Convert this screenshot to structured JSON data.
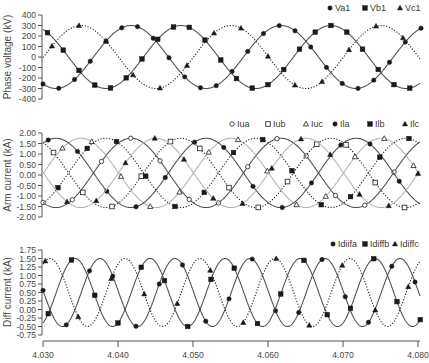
{
  "figure": {
    "x_axis": {
      "ticks": [
        "4.030",
        "4.040",
        "4.050",
        "4.060",
        "4.070",
        "4.080"
      ],
      "tick_values": [
        4.03,
        4.04,
        4.05,
        4.06,
        4.07,
        4.08
      ],
      "xlim": [
        4.03,
        4.08
      ]
    }
  },
  "chart_data": [
    {
      "type": "line",
      "title": "",
      "xlabel": "",
      "ylabel": "Phase voltage (kV)",
      "xlim": [
        4.03,
        4.08
      ],
      "ylim": [
        -400,
        400
      ],
      "yticks": [
        "400",
        "300",
        "200",
        "100",
        "0",
        "-100",
        "-200",
        "-300",
        "-400"
      ],
      "grid": false,
      "legend_position": "top-right",
      "x": [
        4.03,
        4.0325,
        4.035,
        4.0375,
        4.04,
        4.0425,
        4.045,
        4.0475,
        4.05,
        4.0525,
        4.055,
        4.0575,
        4.06,
        4.0625,
        4.065,
        4.0675,
        4.07,
        4.0725,
        4.075,
        4.0775,
        4.08
      ],
      "series": [
        {
          "name": "Va1",
          "marker": "filled-circle",
          "line": "solid-dark",
          "amplitude": 300,
          "offset": 0,
          "frequency_hz": 50,
          "peak_time": 4.04173,
          "marker_every_ms": 2.1,
          "marker_start_ms": 0.0,
          "values": [
            -257,
            -291,
            -155,
            72,
            257,
            291,
            155,
            -72,
            -257,
            -291,
            -155,
            72,
            257,
            291,
            155,
            -72,
            -257,
            -291,
            -155,
            72,
            257
          ]
        },
        {
          "name": "Vb1",
          "marker": "filled-square",
          "line": "solid-dark",
          "amplitude": 300,
          "offset": 0,
          "frequency_hz": 50,
          "peak_time": 4.0484,
          "marker_every_ms": 2.1,
          "marker_start_ms": 0.6,
          "values": [
            263,
            84,
            -145,
            -288,
            -263,
            -84,
            145,
            288,
            263,
            84,
            -145,
            -288,
            -263,
            -84,
            145,
            288,
            263,
            84,
            -145,
            -288,
            -263
          ]
        },
        {
          "name": "Vc1",
          "marker": "filled-triangle",
          "line": "dotted",
          "amplitude": 300,
          "offset": 0,
          "frequency_hz": 50,
          "peak_time": 4.03507,
          "marker_every_ms": 3.6,
          "marker_start_ms": 1.2,
          "values": [
            -6,
            208,
            300,
            217,
            6,
            -208,
            -300,
            -217,
            -6,
            208,
            300,
            217,
            6,
            -208,
            -300,
            -217,
            -6,
            208,
            300,
            217,
            6
          ]
        }
      ]
    },
    {
      "type": "line",
      "title": "",
      "xlabel": "",
      "ylabel": "Arm current (kA)",
      "xlim": [
        4.03,
        4.08
      ],
      "ylim": [
        -2.0,
        2.0
      ],
      "yticks": [
        "2.00",
        "1.50",
        "1.00",
        "0.50",
        "0.00",
        "-0.50",
        "-1.00",
        "-1.50",
        "-2.00"
      ],
      "grid": false,
      "legend_position": "top-right",
      "x": [
        4.03,
        4.0325,
        4.035,
        4.0375,
        4.04,
        4.0425,
        4.045,
        4.0475,
        4.05,
        4.0525,
        4.055,
        4.0575,
        4.06,
        4.0625,
        4.065,
        4.0675,
        4.07,
        4.0725,
        4.075,
        4.0775,
        4.08
      ],
      "series": [
        {
          "name": "Iua",
          "marker": "open-circle",
          "line": "solid-dark",
          "amplitude": 1.65,
          "offset": 0.1,
          "frequency_hz": 50,
          "peak_time": 4.04173,
          "marker_every_ms": 3.9,
          "marker_start_ms": 0.0,
          "values": [
            -1.31,
            -1.5,
            -0.75,
            0.49,
            1.51,
            1.7,
            0.95,
            -0.29,
            -1.31,
            -1.5,
            -0.75,
            0.49,
            1.51,
            1.7,
            0.95,
            -0.29,
            -1.31,
            -1.5,
            -0.75,
            0.49,
            1.51
          ]
        },
        {
          "name": "Iub",
          "marker": "open-square",
          "line": "dotted",
          "amplitude": 1.65,
          "offset": 0.1,
          "frequency_hz": 50,
          "peak_time": 4.0484,
          "marker_every_ms": 3.9,
          "marker_start_ms": 1.4,
          "values": [
            1.55,
            0.56,
            -0.69,
            -1.48,
            -1.35,
            -0.36,
            0.89,
            1.68,
            1.55,
            0.56,
            -0.69,
            -1.48,
            -1.35,
            -0.36,
            0.89,
            1.68,
            1.55,
            0.56,
            -0.69,
            -1.48,
            -1.35
          ]
        },
        {
          "name": "Iuc",
          "marker": "open-triangle",
          "line": "solid-light",
          "amplitude": 1.65,
          "offset": 0.1,
          "frequency_hz": 50,
          "peak_time": 4.03507,
          "marker_every_ms": 3.9,
          "marker_start_ms": 2.6,
          "values": [
            0.07,
            1.24,
            1.75,
            1.29,
            0.13,
            -1.04,
            -1.55,
            -1.09,
            0.07,
            1.24,
            1.75,
            1.29,
            0.13,
            -1.04,
            -1.55,
            -1.09,
            0.07,
            1.24,
            1.75,
            1.29,
            0.13
          ]
        },
        {
          "name": "Ila",
          "marker": "filled-circle",
          "line": "solid-dark",
          "amplitude": 1.65,
          "offset": 0.1,
          "frequency_hz": 50,
          "peak_time": 4.03173,
          "marker_every_ms": 3.9,
          "marker_start_ms": 0.7,
          "values": [
            1.51,
            1.7,
            0.95,
            -0.29,
            -1.31,
            -1.5,
            -0.75,
            0.49,
            1.51,
            1.7,
            0.95,
            -0.29,
            -1.31,
            -1.5,
            -0.75,
            0.49,
            1.51,
            1.7,
            0.95,
            -0.29,
            -1.31
          ]
        },
        {
          "name": "Ilb",
          "marker": "filled-square",
          "line": "dotted",
          "amplitude": 1.65,
          "offset": 0.1,
          "frequency_hz": 50,
          "peak_time": 4.0384,
          "marker_every_ms": 3.9,
          "marker_start_ms": 2.0,
          "values": [
            -1.35,
            -0.36,
            0.89,
            1.68,
            1.55,
            0.56,
            -0.69,
            -1.48,
            -1.35,
            -0.36,
            0.89,
            1.68,
            1.55,
            0.56,
            -0.69,
            -1.48,
            -1.35,
            -0.36,
            0.89,
            1.68,
            1.55
          ]
        },
        {
          "name": "Ilc",
          "marker": "filled-triangle",
          "line": "solid-light",
          "amplitude": 1.65,
          "offset": 0.1,
          "frequency_hz": 50,
          "peak_time": 4.04507,
          "marker_every_ms": 3.9,
          "marker_start_ms": 3.2,
          "values": [
            0.13,
            -1.04,
            -1.55,
            -1.09,
            0.07,
            1.24,
            1.75,
            1.29,
            0.13,
            -1.04,
            -1.55,
            -1.09,
            0.07,
            1.24,
            1.75,
            1.29,
            0.13,
            -1.04,
            -1.55,
            -1.09,
            0.07
          ]
        }
      ]
    },
    {
      "type": "line",
      "title": "",
      "xlabel": "",
      "ylabel": "Diff current (kA)",
      "xlim": [
        4.03,
        4.08
      ],
      "ylim": [
        -0.75,
        1.75
      ],
      "yticks": [
        "1.75",
        "1.50",
        "1.25",
        "1.00",
        "0.75",
        "0.50",
        "0.25",
        "0.00",
        "-0.25",
        "-0.50",
        "-0.75"
      ],
      "xticks": [
        "4.030",
        "4.040",
        "4.050",
        "4.060",
        "4.070",
        "4.080"
      ],
      "grid": false,
      "legend_position": "top-right",
      "x": [
        4.03,
        4.0325,
        4.035,
        4.0375,
        4.04,
        4.0425,
        4.045,
        4.0475,
        4.05,
        4.0525,
        4.055,
        4.0575,
        4.06,
        4.0625,
        4.065,
        4.0675,
        4.07,
        4.0725,
        4.075,
        4.0775,
        4.08
      ],
      "series": [
        {
          "name": "Idiifa",
          "marker": "filled-circle",
          "line": "solid-dark",
          "amplitude": 1.0,
          "offset": 0.5,
          "frequency_hz": 100,
          "peak_time": 4.0376,
          "marker_every_ms": 3.1,
          "marker_start_ms": 0.0,
          "values": [
            0.56,
            -0.5,
            0.44,
            1.5,
            0.56,
            -0.5,
            0.44,
            1.5,
            0.56,
            -0.5,
            0.44,
            1.5,
            0.56,
            -0.5,
            0.44,
            1.5,
            0.56,
            -0.5,
            0.44,
            1.5,
            0.56
          ]
        },
        {
          "name": "Idiffb",
          "marker": "filled-square",
          "line": "solid-dark",
          "amplitude": 1.0,
          "offset": 0.5,
          "frequency_hz": 100,
          "peak_time": 4.03427,
          "marker_every_ms": 3.1,
          "marker_start_ms": 0.7,
          "values": [
            -0.4,
            0.94,
            1.4,
            0.06,
            -0.4,
            0.94,
            1.4,
            0.06,
            -0.4,
            0.94,
            1.4,
            0.06,
            -0.4,
            0.94,
            1.4,
            0.06,
            -0.4,
            0.94,
            1.4,
            0.06,
            -0.4
          ]
        },
        {
          "name": "Idiffc",
          "marker": "filled-triangle",
          "line": "dotted",
          "amplitude": 1.0,
          "offset": 0.5,
          "frequency_hz": 100,
          "peak_time": 4.03093,
          "marker_every_ms": 4.4,
          "marker_start_ms": 0.3,
          "values": [
            1.33,
            1.05,
            -0.33,
            -0.05,
            1.33,
            1.05,
            -0.33,
            -0.05,
            1.33,
            1.05,
            -0.33,
            -0.05,
            1.33,
            1.05,
            -0.33,
            -0.05,
            1.33,
            1.05,
            -0.33,
            -0.05,
            1.33
          ]
        }
      ]
    }
  ]
}
